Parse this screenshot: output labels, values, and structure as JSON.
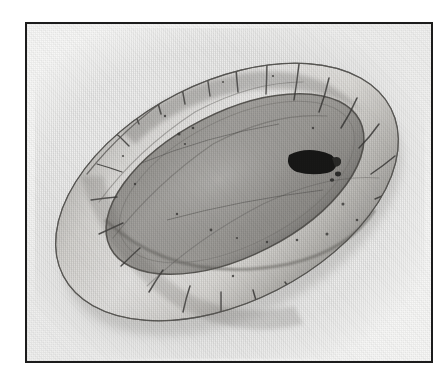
{
  "page": {
    "background_color": "#ffffff",
    "kind": "scanned-halftone-photograph-plate"
  },
  "plate": {
    "frame": {
      "x": 25,
      "y": 22,
      "width": 408,
      "height": 341,
      "border_color": "#1c1c1c",
      "border_width_px": 2
    },
    "paper_color": "#f7f7f6"
  },
  "photo": {
    "subject_name": "oval-padded-tray",
    "description": "Oval object with a thick quilted/padded segmented rim surrounding a flat recessed oval floor, photographed at an oblique three-quarter angle, long axis running from upper-left to lower-right.",
    "orientation_degrees": -27,
    "tones": {
      "rim_highlight": "#efeeec",
      "rim_midtone": "#c9c7c3",
      "rim_shadow": "#8e8c88",
      "floor_fill": "#aaa9a6",
      "floor_shadow": "#8f8e8b",
      "seam_line": "#3a3a38",
      "dark_mark": "#1a1a19",
      "outline": "#5b5a57"
    },
    "features": [
      {
        "name": "padded-rim",
        "note": "continuous tubular bolster with transverse stitched segment divisions"
      },
      {
        "name": "rim-segment-seams",
        "count": 18,
        "note": "short dark lines crossing the bolster"
      },
      {
        "name": "inner-floor",
        "note": "large flat grey oval interior panel"
      },
      {
        "name": "inner-rim-edge",
        "note": "dark crease where bolster meets the floor"
      },
      {
        "name": "dark-mark",
        "note": "solid black irregular blotch on the right side of the floor near the rim",
        "x": 289,
        "y": 155,
        "width": 42,
        "height": 20
      },
      {
        "name": "surface-speckles",
        "note": "scattered small dark flecks across the rim and floor"
      },
      {
        "name": "far-rim-overhang",
        "note": "upper-right rim reads lighter, catching the light"
      }
    ],
    "bounds_in_plate": {
      "x": 18,
      "y": 10,
      "width": 372,
      "height": 316
    }
  }
}
